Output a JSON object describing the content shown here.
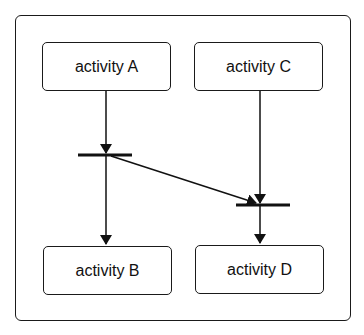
{
  "diagram": {
    "type": "UML activity diagram (fork/join synchronization)",
    "nodes": [
      {
        "id": "A",
        "label": "activity A"
      },
      {
        "id": "B",
        "label": "activity B"
      },
      {
        "id": "C",
        "label": "activity C"
      },
      {
        "id": "D",
        "label": "activity D"
      }
    ],
    "sync_bars": [
      {
        "id": "fork1",
        "kind": "fork"
      },
      {
        "id": "join1",
        "kind": "join"
      }
    ],
    "edges": [
      {
        "from": "A",
        "to": "fork1"
      },
      {
        "from": "fork1",
        "to": "B"
      },
      {
        "from": "fork1",
        "to": "join1"
      },
      {
        "from": "C",
        "to": "join1"
      },
      {
        "from": "join1",
        "to": "D"
      }
    ],
    "colors": {
      "stroke": "#1a1a1a",
      "background": "#ffffff"
    }
  }
}
